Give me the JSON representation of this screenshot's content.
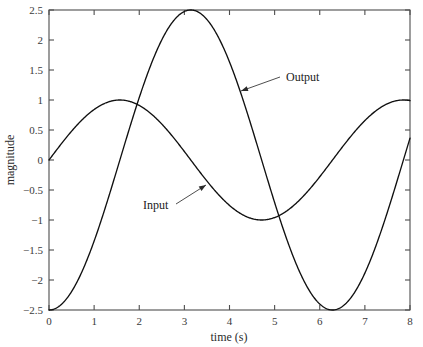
{
  "chart_data": {
    "type": "line",
    "title": "",
    "xlabel": "time (s)",
    "ylabel": "magnitude",
    "xlim": [
      0,
      8
    ],
    "ylim": [
      -2.5,
      2.5
    ],
    "grid": false,
    "legend_position": "inline-annotations",
    "xticks": [
      0,
      1,
      2,
      3,
      4,
      5,
      6,
      7,
      8
    ],
    "xtick_labels": [
      "0",
      "1",
      "2",
      "3",
      "4",
      "5",
      "6",
      "7",
      "8"
    ],
    "yticks": [
      -2.5,
      -2,
      -1.5,
      -1,
      -0.5,
      0,
      0.5,
      1,
      1.5,
      2,
      2.5
    ],
    "ytick_labels": [
      "-2.5",
      "-2",
      "-1.5",
      "-1",
      "-0.5",
      "0",
      "0.5",
      "1",
      "1.5",
      "2",
      "2.5"
    ],
    "series": [
      {
        "name": "Input",
        "color": "#101010",
        "formula": "sin(t)",
        "amplitude": 1,
        "x": [
          0,
          0.25,
          0.5,
          0.75,
          1,
          1.25,
          1.5,
          1.5708,
          1.75,
          2,
          2.25,
          2.5,
          2.75,
          3,
          3.1416,
          3.25,
          3.5,
          3.75,
          4,
          4.25,
          4.5,
          4.7124,
          5,
          5.25,
          5.5,
          5.75,
          6,
          6.25,
          6.2832,
          6.5,
          6.75,
          7,
          7.25,
          7.5,
          7.75,
          8
        ],
        "values": [
          0,
          0.247,
          0.479,
          0.682,
          0.841,
          0.949,
          0.997,
          1,
          0.984,
          0.909,
          0.778,
          0.599,
          0.382,
          0.141,
          0,
          -0.108,
          -0.351,
          -0.572,
          -0.757,
          -0.895,
          -0.978,
          -1,
          -0.959,
          -0.861,
          -0.706,
          -0.501,
          -0.279,
          -0.033,
          0,
          0.216,
          0.437,
          0.657,
          0.833,
          0.938,
          0.988,
          0.989
        ]
      },
      {
        "name": "Output",
        "color": "#101010",
        "formula": "-2.5*cos(t)",
        "amplitude": 2.5,
        "x": [
          0,
          0.25,
          0.5,
          0.75,
          1,
          1.25,
          1.5,
          1.5708,
          1.75,
          2,
          2.25,
          2.5,
          2.75,
          3,
          3.1416,
          3.25,
          3.5,
          3.75,
          4,
          4.25,
          4.5,
          4.7124,
          5,
          5.25,
          5.5,
          5.75,
          6,
          6.25,
          6.2832,
          6.5,
          6.75,
          7,
          7.25,
          7.5,
          7.75,
          8
        ],
        "values": [
          -2.5,
          -2.423,
          -2.194,
          -1.829,
          -1.351,
          -0.787,
          -0.177,
          0,
          0.437,
          1.041,
          1.566,
          2.003,
          2.315,
          2.475,
          2.5,
          2.485,
          2.341,
          2.048,
          1.634,
          1.114,
          0.53,
          0,
          -0.709,
          -1.269,
          -1.769,
          -2.153,
          -2.4,
          -2.497,
          -2.5,
          -2.44,
          -2.188,
          -1.885,
          -1.39,
          -0.866,
          -0.294,
          0.364
        ]
      }
    ],
    "annotations": [
      {
        "text": "Output",
        "label_x": 286,
        "label_y": 81,
        "leader_from_x": 280,
        "leader_from_y": 77,
        "leader_to_x": 241,
        "leader_to_y": 91,
        "arrow": true
      },
      {
        "text": "Input",
        "label_x": 143,
        "label_y": 209,
        "leader_from_x": 176,
        "leader_from_y": 204,
        "leader_to_x": 206,
        "leader_to_y": 185,
        "arrow": true
      }
    ]
  },
  "plot_area": {
    "left": 49,
    "top": 10,
    "right": 410,
    "bottom": 310
  },
  "colors": {
    "curve": "#101010",
    "axis": "#4d4d4d",
    "text": "#1a1a1a",
    "background": "#ffffff"
  }
}
